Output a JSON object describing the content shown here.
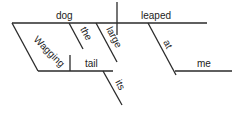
{
  "diagram": {
    "type": "sentence-diagram",
    "sentence_parts": {
      "subject": "dog",
      "predicate": "leaped",
      "subject_modifiers": [
        "the",
        "large"
      ],
      "participial_phrase": {
        "participle": "Wagging",
        "object": "tail",
        "object_modifier": "its"
      },
      "prepositional_phrase": {
        "preposition": "at",
        "object": "me"
      }
    },
    "labels": {
      "dog": "dog",
      "leaped": "leaped",
      "the": "the",
      "large": "large",
      "wagging": "Wagging",
      "tail": "tail",
      "its": "its",
      "at": "at",
      "me": "me"
    },
    "colors": {
      "line": "#2a2a2a",
      "text": "#222222",
      "background": "#ffffff"
    }
  }
}
